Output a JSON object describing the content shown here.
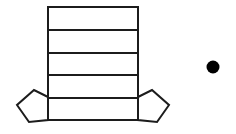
{
  "canvas": {
    "width": 236,
    "height": 134,
    "background_color": "#ffffff",
    "stroke_color": "#1c1c1c",
    "stroke_width": 2,
    "fill_color": "#ffffff"
  },
  "diagram": {
    "shapes": [
      {
        "name": "ladder-rectangle",
        "type": "rectangle",
        "x": 48,
        "y": 7,
        "width": 90,
        "height": 113,
        "row_count": 5,
        "divider_y_positions": [
          30,
          53,
          75,
          98
        ],
        "bottom_extra_line_y": 120
      },
      {
        "name": "left-pentagon",
        "type": "pentagon",
        "orientation": "point-left",
        "points": "48,97 34,90 17,105 29,122 48,120"
      },
      {
        "name": "right-pentagon",
        "type": "pentagon",
        "orientation": "point-right",
        "points": "138,97 152,90 169,105 157,122 138,120"
      },
      {
        "name": "solid-dot",
        "type": "circle",
        "cx": 213,
        "cy": 67,
        "r": 6.5,
        "fill": "#000000"
      }
    ]
  }
}
